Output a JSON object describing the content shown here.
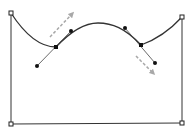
{
  "diagram": {
    "type": "bezier-path-editor",
    "colors": {
      "path": "#333333",
      "handle_line": "#444444",
      "anchor": "#111111",
      "corner_fill": "#ffffff",
      "corner_stroke": "#222222",
      "arrow": "#a8a8a8",
      "background": "#ffffff"
    },
    "corners": [
      {
        "name": "top-left",
        "x": 11,
        "y": 13
      },
      {
        "name": "top-right",
        "x": 182,
        "y": 17
      },
      {
        "name": "bottom-right",
        "x": 182,
        "y": 123
      },
      {
        "name": "bottom-left",
        "x": 11,
        "y": 124
      }
    ],
    "anchors": [
      {
        "name": "left-anchor",
        "x": 56,
        "y": 47,
        "handle_in": {
          "x": 37,
          "y": 66
        },
        "handle_out": {
          "x": 71,
          "y": 31
        }
      },
      {
        "name": "right-anchor",
        "x": 141,
        "y": 45,
        "handle_in": {
          "x": 125,
          "y": 28
        },
        "handle_out": {
          "x": 155,
          "y": 63
        }
      }
    ],
    "arrows": [
      {
        "name": "drag-arrow-up",
        "from": {
          "x": 50,
          "y": 37
        },
        "to": {
          "x": 73,
          "y": 13
        }
      },
      {
        "name": "drag-arrow-down",
        "from": {
          "x": 136,
          "y": 56
        },
        "to": {
          "x": 154,
          "y": 74
        }
      }
    ]
  }
}
